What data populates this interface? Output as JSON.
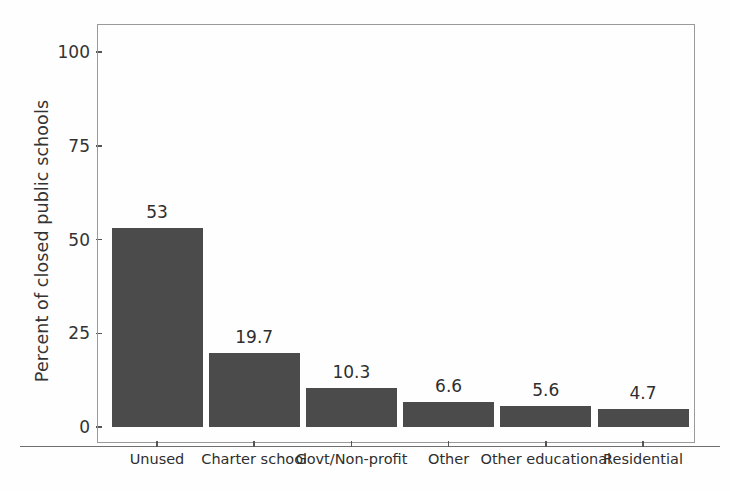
{
  "chart_data": {
    "type": "bar",
    "title": "",
    "xlabel": "",
    "ylabel": "Percent of closed public schools",
    "categories": [
      "Unused",
      "Charter school",
      "Govt/Non-profit",
      "Other",
      "Other educational",
      "Residential"
    ],
    "values": [
      53,
      19.7,
      10.3,
      6.6,
      5.6,
      4.7
    ],
    "value_labels": [
      "53",
      "19.7",
      "10.3",
      "6.6",
      "5.6",
      "4.7"
    ],
    "ylim": [
      0,
      105
    ],
    "y_ticks": [
      0,
      25,
      50,
      75,
      100
    ],
    "y_tick_labels": [
      "0",
      "25",
      "50",
      "75",
      "100"
    ],
    "grid": false,
    "legend": false,
    "bar_color": "#4b4b4b",
    "axis_color": "#9a9a9a",
    "background_color": "#fefefe"
  },
  "axes": {
    "y_title": "Percent of closed public schools"
  }
}
